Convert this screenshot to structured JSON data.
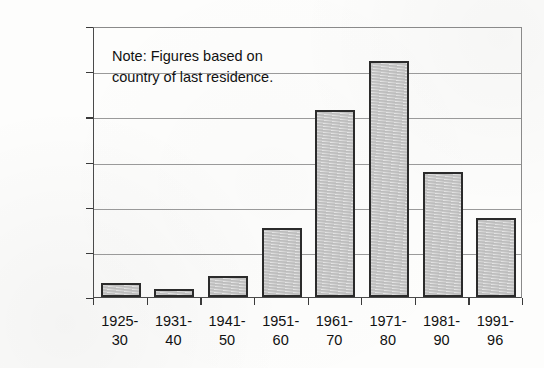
{
  "chart_data": {
    "type": "bar",
    "title": "",
    "xlabel": "",
    "ylabel": "",
    "categories": [
      "1925-30",
      "1931-40",
      "1941-50",
      "1951-60",
      "1961-70",
      "1971-80",
      "1981-90",
      "1991-96"
    ],
    "category_lines": [
      [
        "1925-",
        "30"
      ],
      [
        "1931-",
        "40"
      ],
      [
        "1941-",
        "50"
      ],
      [
        "1951-",
        "60"
      ],
      [
        "1961-",
        "70"
      ],
      [
        "1971-",
        "80"
      ],
      [
        "1981-",
        "90"
      ],
      [
        "1991-",
        "96"
      ]
    ],
    "values": [
      16000,
      9000,
      23000,
      76000,
      207000,
      261000,
      138000,
      88000
    ],
    "ylim": [
      0,
      300000
    ],
    "ytick_values": [
      0,
      50000,
      100000,
      150000,
      200000,
      250000,
      300000
    ],
    "ytick_labels": [
      "0",
      "50,000",
      "100,000",
      "150,000",
      "200,000",
      "250,000",
      "300,000"
    ],
    "grid": true,
    "legend": null,
    "annotations": [
      {
        "name": "note",
        "text": "Note: Figures based on\ncountry of last residence."
      }
    ],
    "colors": {
      "bar_fill": "#c9c9c9",
      "bar_border": "#2b2b2b",
      "gridline": "#9a9a9a",
      "axis": "#3a3a3a",
      "text": "#111111",
      "background": "#fdfdfc"
    }
  }
}
